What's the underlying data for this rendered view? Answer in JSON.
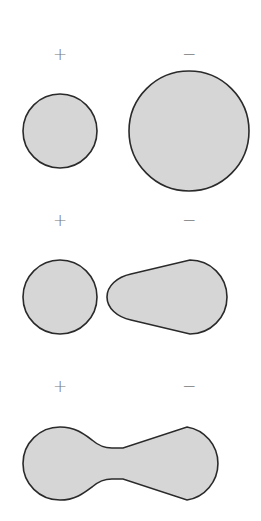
{
  "diagram": {
    "colors": {
      "fill": "#d6d6d6",
      "stroke": "#2a2a2a",
      "sign": "#777777",
      "background": "#ffffff"
    },
    "rows": [
      {
        "left_label": "+",
        "right_label": "−",
        "description": "small positive sphere, separate larger negative sphere"
      },
      {
        "left_label": "+",
        "right_label": "−",
        "description": "positive sphere beside distorted negative teardrop shape"
      },
      {
        "left_label": "+",
        "right_label": "−",
        "description": "merged dumbbell shape (bond formation)"
      }
    ]
  }
}
